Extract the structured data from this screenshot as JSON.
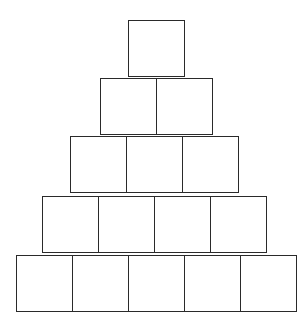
{
  "diagram": {
    "type": "block-pyramid",
    "stroke_color": "#2a2a2a",
    "background_color": "#ffffff",
    "box_size": 56,
    "rows": [
      {
        "count": 1,
        "left": 128,
        "top": 20
      },
      {
        "count": 2,
        "left": 100,
        "top": 78
      },
      {
        "count": 3,
        "left": 70,
        "top": 136
      },
      {
        "count": 4,
        "left": 42,
        "top": 196
      },
      {
        "count": 5,
        "left": 16,
        "top": 255
      }
    ],
    "total_boxes": 15
  }
}
